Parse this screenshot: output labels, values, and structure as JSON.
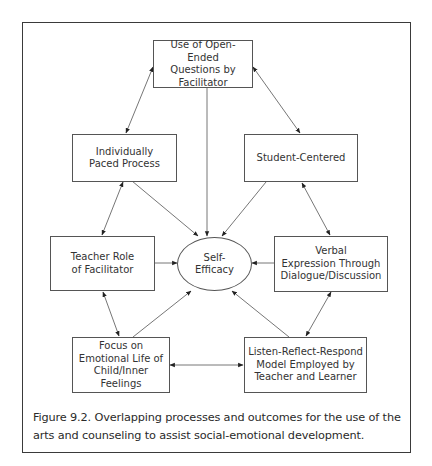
{
  "diagram": {
    "center": {
      "id": "self-efficacy",
      "label": "Self-\nEfficacy",
      "shape": "ellipse"
    },
    "nodes": [
      {
        "id": "open-ended-questions",
        "label": "Use of Open-Ended\nQuestions by\nFacilitator"
      },
      {
        "id": "individually-paced",
        "label": "Individually\nPaced Process"
      },
      {
        "id": "student-centered",
        "label": "Student-Centered"
      },
      {
        "id": "teacher-role",
        "label": "Teacher Role\nof Facilitator"
      },
      {
        "id": "verbal-expression",
        "label": "Verbal\nExpression Through\nDialogue/Discussion"
      },
      {
        "id": "focus-emotional",
        "label": "Focus on\nEmotional Life of\nChild/Inner Feelings"
      },
      {
        "id": "listen-reflect-respond",
        "label": "Listen-Reflect-Respond\nModel Employed by\nTeacher and Learner"
      }
    ],
    "edges": [
      {
        "from": "open-ended-questions",
        "to": "individually-paced",
        "type": "bidirectional"
      },
      {
        "from": "open-ended-questions",
        "to": "student-centered",
        "type": "bidirectional"
      },
      {
        "from": "open-ended-questions",
        "to": "self-efficacy",
        "type": "directed"
      },
      {
        "from": "individually-paced",
        "to": "self-efficacy",
        "type": "directed"
      },
      {
        "from": "student-centered",
        "to": "self-efficacy",
        "type": "directed"
      },
      {
        "from": "individually-paced",
        "to": "teacher-role",
        "type": "bidirectional"
      },
      {
        "from": "student-centered",
        "to": "verbal-expression",
        "type": "bidirectional"
      },
      {
        "from": "teacher-role",
        "to": "self-efficacy",
        "type": "directed"
      },
      {
        "from": "verbal-expression",
        "to": "self-efficacy",
        "type": "directed"
      },
      {
        "from": "teacher-role",
        "to": "focus-emotional",
        "type": "bidirectional"
      },
      {
        "from": "verbal-expression",
        "to": "listen-reflect-respond",
        "type": "bidirectional"
      },
      {
        "from": "focus-emotional",
        "to": "self-efficacy",
        "type": "directed"
      },
      {
        "from": "listen-reflect-respond",
        "to": "self-efficacy",
        "type": "directed"
      },
      {
        "from": "focus-emotional",
        "to": "listen-reflect-respond",
        "type": "bidirectional"
      }
    ]
  },
  "caption": "Figure 9.2. Overlapping processes and outcomes for the use of the arts and counseling to assist social-emotional development.",
  "colors": {
    "line": "#555555",
    "border": "#3a3a3a",
    "text": "#2a2a2a",
    "background": "#ffffff"
  }
}
